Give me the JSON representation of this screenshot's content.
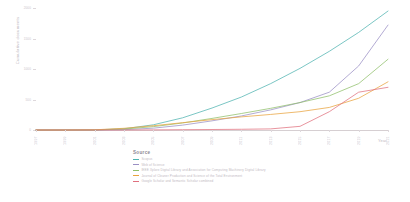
{
  "chart_data": {
    "type": "line",
    "title": "",
    "xlabel": "Year",
    "ylabel": "Cumulative documents",
    "xlim": [
      1997,
      2021
    ],
    "ylim": [
      0,
      2000
    ],
    "grid": false,
    "legend_position": "bottom",
    "legend_title": "Source",
    "x_ticks": [
      "1997",
      "1999",
      "2001",
      "2003",
      "2005",
      "2007",
      "2009",
      "2011",
      "2013",
      "2015",
      "2017",
      "2019",
      "2021"
    ],
    "y_ticks": [
      "0",
      "500",
      "1000",
      "1500",
      "2000"
    ],
    "x": [
      1997,
      1999,
      2001,
      2003,
      2005,
      2007,
      2009,
      2011,
      2013,
      2015,
      2017,
      2019,
      2021
    ],
    "series": [
      {
        "name": "Scopus",
        "color": "#4fb3b0",
        "values": [
          0,
          0,
          2,
          20,
          85,
          200,
          360,
          540,
          760,
          1010,
          1290,
          1600,
          1950
        ]
      },
      {
        "name": "Web of Science",
        "color": "#9a8fc4",
        "values": [
          0,
          0,
          0,
          5,
          30,
          80,
          150,
          230,
          330,
          450,
          620,
          1050,
          1720
        ]
      },
      {
        "name": "IEEE Xplore Digital Library and Association for Computing Machinery Digital Library",
        "color": "#8fbf6a",
        "values": [
          0,
          0,
          1,
          15,
          55,
          115,
          190,
          270,
          355,
          450,
          560,
          760,
          1160
        ]
      },
      {
        "name": "Journal of Cleaner Production and Science of the Total Environment",
        "color": "#e8a33d",
        "values": [
          0,
          0,
          3,
          28,
          70,
          120,
          170,
          215,
          255,
          300,
          370,
          520,
          790
        ]
      },
      {
        "name": "Google Scholar and Semantic Scholar combined",
        "color": "#e0707e",
        "values": [
          0,
          0,
          0,
          0,
          2,
          5,
          8,
          12,
          18,
          60,
          300,
          620,
          700
        ]
      }
    ]
  }
}
